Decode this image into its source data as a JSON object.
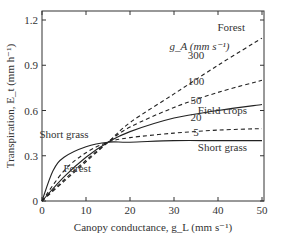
{
  "chart_data": {
    "type": "line",
    "title": "",
    "xlabel": "Canopy conductance, g_L (mm s⁻¹)",
    "ylabel": "Transpiration, E_t (mm h⁻¹)",
    "xlim": [
      0,
      50
    ],
    "ylim": [
      0,
      1.2
    ],
    "xticks": [
      0,
      10,
      20,
      30,
      40,
      50
    ],
    "xtick_labels": [
      "0",
      "10",
      "20",
      "30",
      "40",
      "50"
    ],
    "yticks": [
      0,
      0.3,
      0.6,
      0.9,
      1.2
    ],
    "ytick_labels": [
      "0",
      "0.3",
      "0.6",
      "0.9",
      "1.2"
    ],
    "grid": false,
    "legend_title": "g_A (mm s⁻¹)",
    "crossover": {
      "x": 15,
      "y": 0.39
    },
    "series": [
      {
        "name": "300",
        "style": "dashed",
        "x": [
          0,
          5,
          10,
          15,
          20,
          30,
          40,
          50
        ],
        "y": [
          0,
          0.13,
          0.26,
          0.39,
          0.52,
          0.71,
          0.9,
          1.08
        ]
      },
      {
        "name": "100",
        "style": "dashed",
        "x": [
          0,
          5,
          10,
          15,
          20,
          30,
          40,
          50
        ],
        "y": [
          0,
          0.14,
          0.27,
          0.39,
          0.49,
          0.62,
          0.72,
          0.8
        ]
      },
      {
        "name": "50",
        "style": "solid",
        "x": [
          0,
          5,
          10,
          15,
          20,
          30,
          40,
          50
        ],
        "y": [
          0,
          0.16,
          0.29,
          0.39,
          0.46,
          0.55,
          0.6,
          0.64
        ]
      },
      {
        "name": "20",
        "style": "dashed",
        "x": [
          0,
          5,
          10,
          15,
          20,
          30,
          40,
          50
        ],
        "y": [
          0,
          0.2,
          0.32,
          0.39,
          0.42,
          0.45,
          0.47,
          0.48
        ]
      },
      {
        "name": "5",
        "style": "solid",
        "x": [
          0,
          2.5,
          5,
          10,
          15,
          20,
          30,
          40,
          50
        ],
        "y": [
          0,
          0.2,
          0.29,
          0.36,
          0.39,
          0.39,
          0.4,
          0.4,
          0.4
        ]
      }
    ],
    "annotations": [
      {
        "text": "Forest",
        "x": 43,
        "y": 1.13
      },
      {
        "text": "300",
        "x": 35,
        "y": 0.94
      },
      {
        "text": "100",
        "x": 35,
        "y": 0.77
      },
      {
        "text": "50",
        "x": 35,
        "y": 0.64
      },
      {
        "text": "20",
        "x": 35,
        "y": 0.53
      },
      {
        "text": "5",
        "x": 35,
        "y": 0.43
      },
      {
        "text": "Field crops",
        "x": 41,
        "y": 0.58
      },
      {
        "text": "Short grass",
        "x": 41,
        "y": 0.33
      },
      {
        "text": "Short grass",
        "x": 5,
        "y": 0.42
      },
      {
        "text": "Forest",
        "x": 8,
        "y": 0.19
      }
    ]
  }
}
